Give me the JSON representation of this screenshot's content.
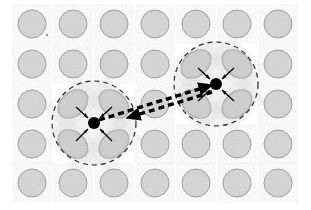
{
  "figure": {
    "width": 311,
    "height": 210,
    "background": "#ffffff"
  },
  "colors": {
    "atom_fill": "#d6d6d6",
    "atom_stroke": "#9a9a9a",
    "distorted_fill": "#cfcfcf",
    "distorted_stroke": "#8f8f8f",
    "halo_fill": "#f2f2f2",
    "halo_stroke": "#2b2b2b",
    "charge_fill": "#000000",
    "arrow_color": "#000000",
    "displacement_arrow": "#000000"
  },
  "lattice": {
    "label": "atom-lattice",
    "columns": 7,
    "rows": 5,
    "column_x": [
      32,
      73,
      114,
      155,
      196,
      237,
      278
    ],
    "row_y": [
      24,
      64,
      104,
      144,
      183
    ],
    "atom_radius": 14,
    "spacing_x": 41,
    "spacing_y": 40
  },
  "polarons": [
    {
      "id": "polaron-left",
      "label": "left polaron",
      "center": [
        94,
        123
      ],
      "halo_radius": 42,
      "charge_radius": 6,
      "distorted_neighbors": [
        {
          "cx": 73,
          "cy": 104,
          "rx": 17,
          "ry": 12,
          "angle": -42
        },
        {
          "cx": 114,
          "cy": 104,
          "rx": 17,
          "ry": 12,
          "angle": 42
        },
        {
          "cx": 73,
          "cy": 144,
          "rx": 17,
          "ry": 12,
          "angle": 42
        },
        {
          "cx": 114,
          "cy": 144,
          "rx": 17,
          "ry": 12,
          "angle": -42
        }
      ],
      "displacement_arrows": [
        {
          "x1": 76,
          "y1": 107,
          "x2": 88,
          "y2": 118
        },
        {
          "x1": 112,
          "y1": 107,
          "x2": 100,
          "y2": 118
        },
        {
          "x1": 76,
          "y1": 141,
          "x2": 88,
          "y2": 129
        },
        {
          "x1": 112,
          "y1": 141,
          "x2": 100,
          "y2": 129
        }
      ]
    },
    {
      "id": "polaron-right",
      "label": "right polaron",
      "center": [
        216,
        84
      ],
      "halo_radius": 42,
      "charge_radius": 6,
      "distorted_neighbors": [
        {
          "cx": 196,
          "cy": 64,
          "rx": 17,
          "ry": 12,
          "angle": -42
        },
        {
          "cx": 237,
          "cy": 64,
          "rx": 17,
          "ry": 12,
          "angle": 42
        },
        {
          "cx": 196,
          "cy": 104,
          "rx": 17,
          "ry": 12,
          "angle": 42
        },
        {
          "cx": 237,
          "cy": 104,
          "rx": 17,
          "ry": 12,
          "angle": -42
        }
      ],
      "displacement_arrows": [
        {
          "x1": 198,
          "y1": 68,
          "x2": 210,
          "y2": 79
        },
        {
          "x1": 234,
          "y1": 68,
          "x2": 222,
          "y2": 79
        },
        {
          "x1": 198,
          "y1": 101,
          "x2": 210,
          "y2": 90
        },
        {
          "x1": 234,
          "y1": 101,
          "x2": 222,
          "y2": 90
        }
      ]
    }
  ],
  "transfer_arrows": [
    {
      "id": "hop-arrow-forward",
      "label": "hop left to right",
      "x1": 99,
      "y1": 120,
      "x2": 212,
      "y2": 85,
      "direction": "right"
    },
    {
      "id": "hop-arrow-backward",
      "label": "hop right to left",
      "x1": 212,
      "y1": 92,
      "x2": 127,
      "y2": 118,
      "direction": "left"
    }
  ],
  "annotations": {
    "speck": {
      "cx": 47,
      "cy": 35,
      "r": 1.2
    }
  }
}
